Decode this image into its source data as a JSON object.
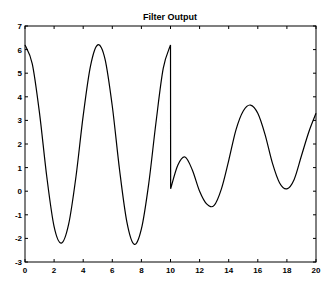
{
  "chart_data": {
    "type": "line",
    "title": "Filter Output",
    "xlabel": "",
    "ylabel": "",
    "xlim": [
      0,
      20
    ],
    "ylim": [
      -3,
      7
    ],
    "xticks": [
      0,
      2,
      4,
      6,
      8,
      10,
      12,
      14,
      16,
      18,
      20
    ],
    "yticks": [
      -3,
      -2,
      -1,
      0,
      1,
      2,
      3,
      4,
      5,
      6,
      7
    ],
    "grid": false,
    "legend": null,
    "series": [
      {
        "name": "Filter Output",
        "color": "#000000",
        "x": [
          0,
          0.5,
          1,
          1.5,
          2,
          2.5,
          3,
          3.5,
          4,
          4.5,
          5,
          5.5,
          6,
          6.5,
          7,
          7.5,
          8,
          8.5,
          9,
          9.5,
          10,
          10.01,
          10.5,
          11,
          11.5,
          12,
          12.5,
          13,
          13.5,
          14,
          14.5,
          15,
          15.5,
          16,
          16.5,
          17,
          17.5,
          18,
          18.5,
          19,
          19.5,
          20
        ],
        "y": [
          6.2,
          5.4,
          3.3,
          0.6,
          -1.5,
          -2.2,
          -1.4,
          0.6,
          3.2,
          5.3,
          6.2,
          5.6,
          3.6,
          0.9,
          -1.3,
          -2.25,
          -1.6,
          0.3,
          2.9,
          5.2,
          6.2,
          0.1,
          1.1,
          1.45,
          0.9,
          0.0,
          -0.55,
          -0.6,
          0.1,
          1.3,
          2.6,
          3.4,
          3.65,
          3.3,
          2.4,
          1.2,
          0.35,
          0.1,
          0.5,
          1.5,
          2.5,
          3.3
        ]
      }
    ]
  }
}
